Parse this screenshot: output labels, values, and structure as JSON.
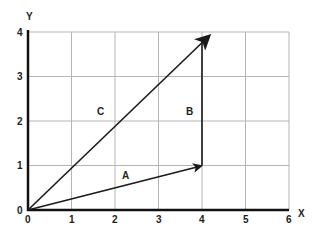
{
  "diagram": {
    "type": "vector-addition",
    "x_axis": {
      "label": "X",
      "ticks": [
        "0",
        "1",
        "2",
        "3",
        "4",
        "5",
        "6"
      ],
      "range": [
        0,
        6
      ]
    },
    "y_axis": {
      "label": "Y",
      "ticks": [
        "0",
        "1",
        "2",
        "3",
        "4"
      ],
      "range": [
        0,
        4
      ]
    },
    "vectors": [
      {
        "name": "A",
        "from": [
          0,
          0
        ],
        "to": [
          4,
          1
        ],
        "label_at": [
          2.25,
          0.78
        ]
      },
      {
        "name": "B",
        "from": [
          4,
          1
        ],
        "to": [
          4,
          4
        ],
        "label_at": [
          3.75,
          2.2
        ]
      },
      {
        "name": "C",
        "from": [
          0,
          0
        ],
        "to": [
          4,
          4
        ],
        "label_at": [
          1.7,
          2.2
        ]
      }
    ],
    "labels": {
      "x": "X",
      "y": "Y",
      "a": "A",
      "b": "B",
      "c": "C"
    },
    "colors": {
      "grid": "#b5b5b5",
      "axis": "#111111",
      "vector": "#1a1a1a"
    }
  }
}
